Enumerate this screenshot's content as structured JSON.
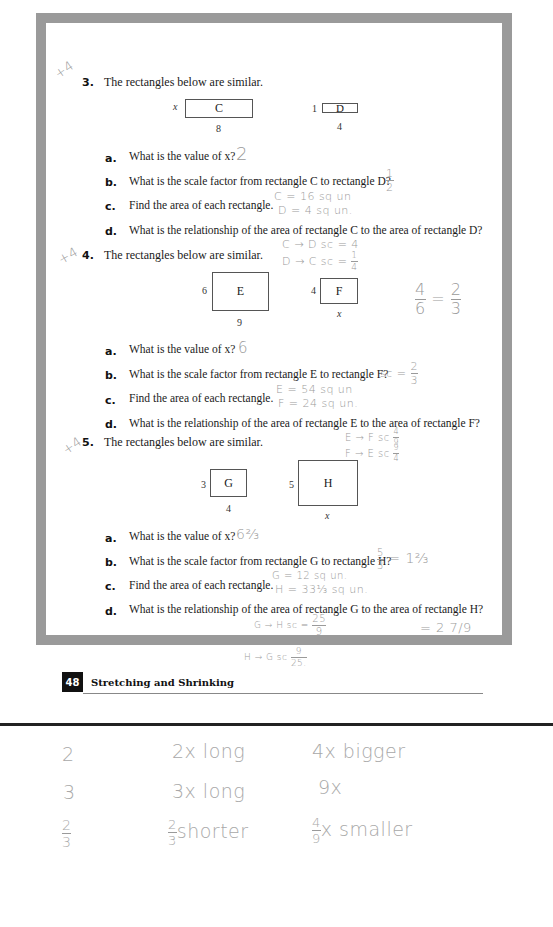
{
  "frame_color": "#9a9a9a",
  "handwriting_color": "#9a9a9a",
  "problems": [
    {
      "number": "3.",
      "margin_mark": "+4",
      "prompt": "The rectangles below are similar.",
      "rectangles": [
        {
          "label": "C",
          "side": "x",
          "bottom": "8"
        },
        {
          "label": "D",
          "side": "1",
          "bottom": "4"
        }
      ],
      "parts": [
        {
          "letter": "a.",
          "text": "What is the value of x?",
          "answer": "2"
        },
        {
          "letter": "b.",
          "text": "What is the scale factor from rectangle C to rectangle D?",
          "answer_num": "1",
          "answer_den": "2"
        },
        {
          "letter": "c.",
          "text": "Find the area of each rectangle.",
          "answer_line1": "C = 16 sq un",
          "answer_line2": "D = 4 sq un."
        },
        {
          "letter": "d.",
          "text": "What is the relationship of the area of rectangle C to the area of rectangle D?",
          "answer_line1": "C → D sc = 4",
          "answer_line2_prefix": "D → C sc =",
          "answer_line2_num": "1",
          "answer_line2_den": "4"
        }
      ]
    },
    {
      "number": "4.",
      "margin_mark": "+4",
      "prompt": "The rectangles below are similar.",
      "rectangles": [
        {
          "label": "E",
          "side": "6",
          "bottom": "9"
        },
        {
          "label": "F",
          "side": "4",
          "bottom": "x"
        }
      ],
      "side_note": {
        "num1": "4",
        "den1": "6",
        "eq": "=",
        "num2": "2",
        "den2": "3"
      },
      "parts": [
        {
          "letter": "a.",
          "text": "What is the value of x?",
          "answer": "6"
        },
        {
          "letter": "b.",
          "text": "What is the scale factor from rectangle E to rectangle F?",
          "answer_prefix": "sc =",
          "answer_num": "2",
          "answer_den": "3"
        },
        {
          "letter": "c.",
          "text": "Find the area of each rectangle.",
          "answer_line1": "E = 54 sq un",
          "answer_line2": "F = 24 sq un."
        },
        {
          "letter": "d.",
          "text": "What is the relationship of the area of rectangle E to the area of rectangle F?",
          "answer_line1_prefix": "E → F sc",
          "answer_line1_num": "4",
          "answer_line1_den": "9",
          "answer_line2_prefix": "F → E sc",
          "answer_line2_num": "9",
          "answer_line2_den": "4"
        }
      ]
    },
    {
      "number": "5.",
      "margin_mark": "+4",
      "prompt": "The rectangles below are similar.",
      "rectangles": [
        {
          "label": "G",
          "side": "3",
          "bottom": "4"
        },
        {
          "label": "H",
          "side": "5",
          "bottom": "x"
        }
      ],
      "parts": [
        {
          "letter": "a.",
          "text": "What is the value of x?",
          "answer": "6⅔"
        },
        {
          "letter": "b.",
          "text": "What is the scale factor from rectangle G to rectangle H?",
          "answer_num": "5",
          "answer_den": "3",
          "answer_suffix": "= 1⅔"
        },
        {
          "letter": "c.",
          "text": "Find the area of each rectangle.",
          "answer_line1": "G = 12 sq un.",
          "answer_line2": "H = 33⅓ sq un."
        },
        {
          "letter": "d.",
          "text": "What is the relationship of the area of rectangle G to the area of rectangle H?",
          "answer_line1_prefix": "G → H sc =",
          "answer_line1_num": "25",
          "answer_line1_den": "9",
          "answer_line2_prefix": "H → G sc",
          "answer_line2_num": "9",
          "answer_line2_den": "25.",
          "answer_side": "= 2 7/9"
        }
      ]
    }
  ],
  "footer": {
    "page_number": "48",
    "title": "Stretching and Shrinking"
  },
  "notes": {
    "rows": [
      {
        "col1": "2",
        "col2": "2x long",
        "col3": "4x bigger"
      },
      {
        "col1": "3",
        "col2": "3x long",
        "col3": "9x"
      },
      {
        "col1_num": "2",
        "col1_den": "3",
        "col2_num": "2",
        "col2_den": "3",
        "col2_suffix": "shorter",
        "col3_num": "4",
        "col3_den": "9",
        "col3_suffix": "x smaller"
      }
    ]
  }
}
